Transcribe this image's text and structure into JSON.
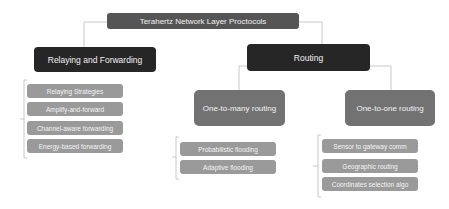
{
  "diagram": {
    "root": {
      "label": "Terahertz Network Layer Proctocols"
    },
    "branches": [
      {
        "label": "Relaying and Forwarding",
        "items": [
          "Relaying Strategies",
          "Amplify-and-forward",
          "Channel-aware forwarding",
          "Energy-based forwarding"
        ]
      },
      {
        "label": "Routing",
        "children": [
          {
            "label": "One-to-many routing",
            "items": [
              "Probabilistic flooding",
              "Adaptive flooding"
            ]
          },
          {
            "label": "One-to-one routing",
            "items": [
              "Sensor to gateway comm",
              "Geographic routing",
              "Coordinates selection algo"
            ]
          }
        ]
      }
    ]
  },
  "colors": {
    "root": "#555555",
    "level1": "#262626",
    "level2": "#727272",
    "leaf": "#9a9a9a",
    "connector": "#c8c8c8"
  }
}
